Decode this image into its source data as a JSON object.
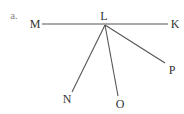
{
  "diagram": {
    "part_label": "a.",
    "vertex": {
      "name": "L",
      "x": 105,
      "y": 25,
      "label_x": 104,
      "label_y": 20
    },
    "line": {
      "from": {
        "name": "M",
        "x": 42,
        "y": 24,
        "label_x": 35,
        "label_y": 28
      },
      "to": {
        "name": "K",
        "x": 168,
        "y": 24,
        "label_x": 175,
        "label_y": 28
      }
    },
    "rays": [
      {
        "name": "N",
        "x": 72,
        "y": 92,
        "label_x": 67,
        "label_y": 103
      },
      {
        "name": "O",
        "x": 118,
        "y": 96,
        "label_x": 120,
        "label_y": 108
      },
      {
        "name": "P",
        "x": 165,
        "y": 63,
        "label_x": 172,
        "label_y": 74
      }
    ],
    "colors": {
      "line": "#555555",
      "text": "#333333",
      "part_label": "#888888"
    }
  }
}
